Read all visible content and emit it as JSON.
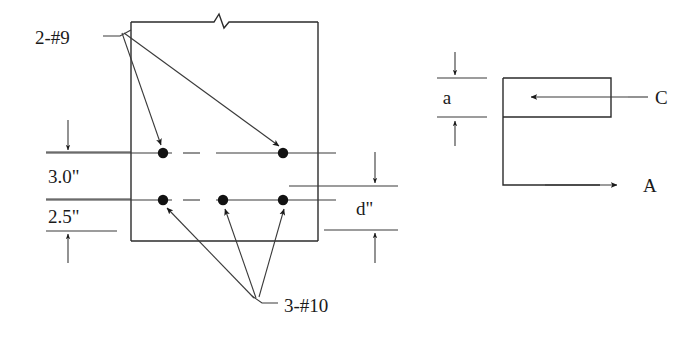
{
  "figure": {
    "title_visible": false,
    "type": "reinforced-concrete-beam-section-and-stress-block",
    "line_color": "#2b2b2b",
    "bar_dot_color": "#121212",
    "background": "#ffffff"
  },
  "section": {
    "labels": {
      "top_bars": "2-#9",
      "bottom_bars": "3-#10"
    },
    "dimensions": [
      {
        "name": "cover-to-top-bars",
        "value": "3.0\""
      },
      {
        "name": "top-bars-to-bottom-bars",
        "value": "2.5\""
      },
      {
        "name": "effective-depth",
        "value": "d\""
      }
    ],
    "bar_rows": [
      {
        "row": "top",
        "designation": "#9",
        "count": 2,
        "x_positions": [
          163,
          283
        ],
        "y": 153
      },
      {
        "row": "bottom",
        "designation": "#10",
        "count": 3,
        "x_positions": [
          163,
          223,
          283
        ],
        "y": 200
      }
    ],
    "break_symbol": "zigzag-break"
  },
  "stress_block": {
    "labels": {
      "depth": "a",
      "compression_force": "C",
      "tension_force": "A"
    },
    "compression_arrow_direction": "left",
    "tension_arrow_direction": "right"
  }
}
